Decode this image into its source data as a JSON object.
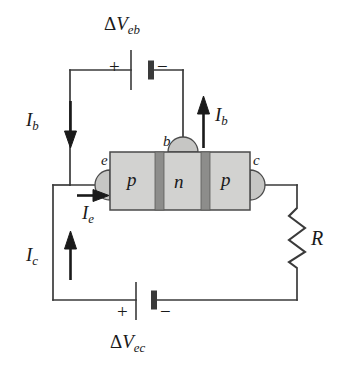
{
  "figure": {
    "type": "circuit-diagram",
    "background_color": "#ffffff",
    "wire_color": "#3a3a3a"
  },
  "transistor": {
    "name": "pnp-transistor",
    "body_color": "#d2d2d0",
    "junction_color": "#8d8d8b",
    "outline_color": "#4a4a4a",
    "regions": [
      {
        "label": "p",
        "name": "emitter-region"
      },
      {
        "label": "n",
        "name": "base-region"
      },
      {
        "label": "p",
        "name": "collector-region"
      }
    ],
    "terminals": [
      {
        "label": "e",
        "name": "emitter-terminal"
      },
      {
        "label": "b",
        "name": "base-terminal"
      },
      {
        "label": "c",
        "name": "collector-terminal"
      }
    ]
  },
  "sources": {
    "base_supply": {
      "name": "base-emitter-battery",
      "label_delta": "Δ",
      "label_v": "V",
      "label_sub": "eb",
      "plus": "+",
      "minus": "−"
    },
    "collector_supply": {
      "name": "emitter-collector-battery",
      "label_delta": "Δ",
      "label_v": "V",
      "label_sub": "ec",
      "plus": "+",
      "minus": "−"
    }
  },
  "resistor": {
    "name": "load-resistor",
    "label": "R"
  },
  "currents": [
    {
      "name": "base-current-left",
      "symbol": "I",
      "subscript": "b",
      "direction": "down"
    },
    {
      "name": "base-current-right",
      "symbol": "I",
      "subscript": "b",
      "direction": "up"
    },
    {
      "name": "emitter-current",
      "symbol": "I",
      "subscript": "e",
      "direction": "right"
    },
    {
      "name": "collector-current",
      "symbol": "I",
      "subscript": "c",
      "direction": "up"
    }
  ]
}
